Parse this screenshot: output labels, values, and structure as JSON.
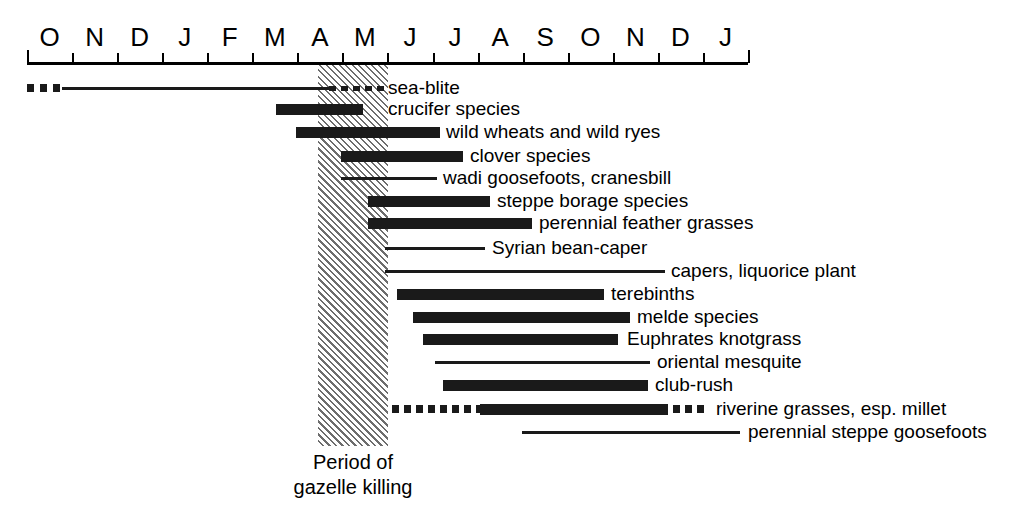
{
  "figure": {
    "caption_line1": "Period of",
    "caption_line2": "gazelle killing",
    "band_label": "Period of gazelle killing"
  },
  "axis": {
    "months": [
      "O",
      "N",
      "D",
      "J",
      "F",
      "M",
      "A",
      "M",
      "J",
      "J",
      "A",
      "S",
      "O",
      "N",
      "D",
      "J"
    ],
    "start_px": 27,
    "end_px": 748,
    "month_width_px": 45.06
  },
  "colors": {
    "bar": "#1a1a1a",
    "hatch": "#6d6d6d",
    "background": "#ffffff",
    "axis": "#000000"
  },
  "chart_data": {
    "type": "bar",
    "title": "",
    "subtitle": "",
    "xlabel": "",
    "ylabel": "",
    "orientation": "horizontal",
    "chart_style": "gantt-availability-timeline",
    "grid": false,
    "legend": null,
    "x_axis": {
      "type": "categorical-month",
      "categories": [
        "O",
        "N",
        "D",
        "J",
        "F",
        "M",
        "A",
        "M",
        "J",
        "J",
        "A",
        "S",
        "O",
        "N",
        "D",
        "J"
      ],
      "tick_labels": [
        "O",
        "N",
        "D",
        "J",
        "F",
        "M",
        "A",
        "M",
        "J",
        "J",
        "A",
        "S",
        "O",
        "N",
        "D",
        "J"
      ],
      "range_months": [
        0,
        16
      ]
    },
    "annotations": [
      {
        "name": "gazelle-killing-band",
        "text": "Period of gazelle killing",
        "start_month_index": 6.46,
        "end_month_index": 8.01,
        "style": "diagonal-hatch"
      }
    ],
    "categories": [
      "sea-blite",
      "crucifer species",
      "wild wheats and wild ryes",
      "clover species",
      "wadi goosefoots, cranesbill",
      "steppe borage species",
      "perennial feather grasses",
      "Syrian bean-caper",
      "capers, liquorice plant",
      "terebinths",
      "melde species",
      "Euphrates knotgrass",
      "oriental mesquite",
      "club-rush",
      "riverine grasses, esp. millet",
      "perennial steppe goosefoots"
    ],
    "bars": [
      {
        "label": "sea-blite",
        "row": 0,
        "y_px": 78,
        "label_x_px": 388,
        "start_month_index": 0.0,
        "end_month_index": 7.9,
        "segments": [
          {
            "style": "dots",
            "x_px": 27,
            "width_px": 35,
            "dot_w": 7,
            "gap": 6,
            "thickness": "thick"
          },
          {
            "style": "solid",
            "x_px": 62,
            "width_px": 267,
            "thickness": "thin"
          },
          {
            "style": "dashes",
            "x_px": 329,
            "width_px": 56,
            "dot_w": 7,
            "gap": 5,
            "thickness": "thin"
          }
        ]
      },
      {
        "label": "crucifer species",
        "row": 1,
        "y_px": 99,
        "label_x_px": 388,
        "start_month_index": 5.53,
        "end_month_index": 7.46,
        "segments": [
          {
            "style": "solid",
            "x_px": 276,
            "width_px": 87,
            "thickness": "thick"
          }
        ]
      },
      {
        "label": "wild wheats and wild ryes",
        "row": 2,
        "y_px": 122,
        "label_x_px": 446,
        "start_month_index": 5.97,
        "end_month_index": 9.17,
        "segments": [
          {
            "style": "solid",
            "x_px": 296,
            "width_px": 144,
            "thickness": "thick"
          }
        ]
      },
      {
        "label": "clover species",
        "row": 3,
        "y_px": 146,
        "label_x_px": 470,
        "start_month_index": 6.97,
        "end_month_index": 9.68,
        "segments": [
          {
            "style": "solid",
            "x_px": 341,
            "width_px": 122,
            "thickness": "thick"
          }
        ]
      },
      {
        "label": "wadi goosefoots, cranesbill",
        "row": 4,
        "y_px": 168,
        "label_x_px": 443,
        "start_month_index": 6.97,
        "end_month_index": 9.1,
        "segments": [
          {
            "style": "solid",
            "x_px": 341,
            "width_px": 96,
            "thickness": "thin"
          }
        ]
      },
      {
        "label": "steppe borage species",
        "row": 5,
        "y_px": 191,
        "label_x_px": 497,
        "start_month_index": 7.57,
        "end_month_index": 10.28,
        "segments": [
          {
            "style": "solid",
            "x_px": 368,
            "width_px": 122,
            "thickness": "thick"
          }
        ]
      },
      {
        "label": "perennial feather grasses",
        "row": 6,
        "y_px": 213,
        "label_x_px": 539,
        "start_month_index": 7.57,
        "end_month_index": 11.21,
        "segments": [
          {
            "style": "solid",
            "x_px": 368,
            "width_px": 164,
            "thickness": "thick"
          }
        ]
      },
      {
        "label": "Syrian bean-caper",
        "row": 7,
        "y_px": 238,
        "label_x_px": 492,
        "start_month_index": 7.94,
        "end_month_index": 10.17,
        "segments": [
          {
            "style": "solid",
            "x_px": 385,
            "width_px": 100,
            "thickness": "thin"
          }
        ]
      },
      {
        "label": "capers, liquorice plant",
        "row": 8,
        "y_px": 261,
        "label_x_px": 671,
        "start_month_index": 7.94,
        "end_month_index": 14.16,
        "segments": [
          {
            "style": "solid",
            "x_px": 385,
            "width_px": 280,
            "thickness": "thin"
          }
        ]
      },
      {
        "label": "terebinths",
        "row": 9,
        "y_px": 284,
        "label_x_px": 611,
        "start_month_index": 8.21,
        "end_month_index": 12.81,
        "segments": [
          {
            "style": "solid",
            "x_px": 397,
            "width_px": 207,
            "thickness": "thick"
          }
        ]
      },
      {
        "label": "melde species",
        "row": 10,
        "y_px": 307,
        "label_x_px": 637,
        "start_month_index": 8.56,
        "end_month_index": 13.38,
        "segments": [
          {
            "style": "solid",
            "x_px": 413,
            "width_px": 217,
            "thickness": "thick"
          }
        ]
      },
      {
        "label": "Euphrates knotgrass",
        "row": 11,
        "y_px": 329,
        "label_x_px": 627,
        "start_month_index": 8.79,
        "end_month_index": 13.11,
        "segments": [
          {
            "style": "solid",
            "x_px": 423,
            "width_px": 195,
            "thickness": "thick"
          }
        ]
      },
      {
        "label": "oriental mesquite",
        "row": 12,
        "y_px": 352,
        "label_x_px": 657,
        "start_month_index": 9.05,
        "end_month_index": 13.82,
        "segments": [
          {
            "style": "solid",
            "x_px": 435,
            "width_px": 215,
            "thickness": "thin"
          }
        ]
      },
      {
        "label": "club-rush",
        "row": 13,
        "y_px": 375,
        "label_x_px": 655,
        "start_month_index": 9.23,
        "end_month_index": 13.78,
        "segments": [
          {
            "style": "solid",
            "x_px": 443,
            "width_px": 205,
            "thickness": "thick"
          }
        ]
      },
      {
        "label": "riverine grasses, esp. millet",
        "row": 14,
        "y_px": 399,
        "label_x_px": 716,
        "start_month_index": 8.1,
        "end_month_index": 15.11,
        "segments": [
          {
            "style": "dots",
            "x_px": 392,
            "width_px": 88,
            "dot_w": 7,
            "gap": 5,
            "thickness": "thick"
          },
          {
            "style": "solid",
            "x_px": 480,
            "width_px": 188,
            "thickness": "thick"
          },
          {
            "style": "dots",
            "x_px": 673,
            "width_px": 35,
            "dot_w": 7,
            "gap": 5,
            "thickness": "thick"
          }
        ]
      },
      {
        "label": "perennial steppe goosefoots",
        "row": 15,
        "y_px": 422,
        "label_x_px": 748,
        "start_month_index": 10.98,
        "end_month_index": 15.82,
        "segments": [
          {
            "style": "solid",
            "x_px": 522,
            "width_px": 218,
            "thickness": "thin"
          }
        ]
      }
    ]
  }
}
